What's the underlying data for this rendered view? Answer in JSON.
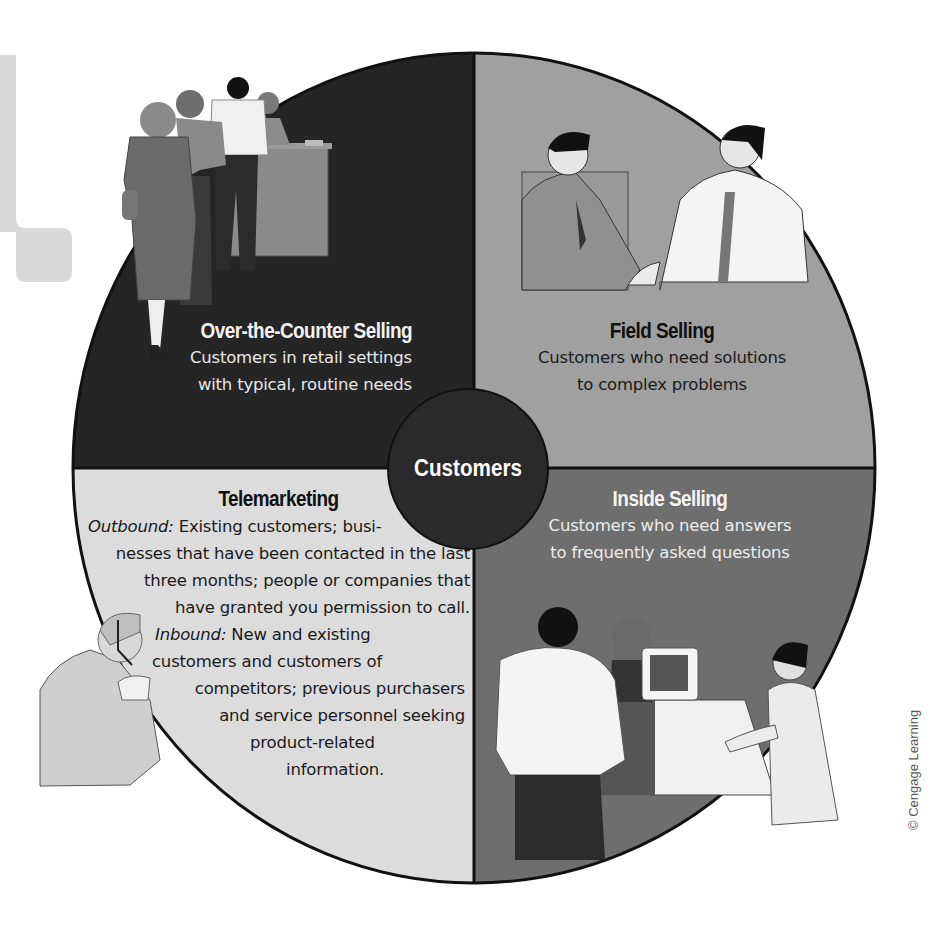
{
  "diagram": {
    "center": {
      "label": "Customers",
      "color": "#2a2a2a"
    },
    "quadrants": [
      {
        "id": "over-the-counter",
        "position": "top-left",
        "title": "Over-the-Counter Selling",
        "lines": [
          "Customers in retail settings",
          "with typical, routine needs"
        ],
        "fill": "#252525",
        "text_color": "#e8e8e8",
        "illustration": "people-waiting-in-line-at-counter"
      },
      {
        "id": "field-selling",
        "position": "top-right",
        "title": "Field Selling",
        "lines": [
          "Customers who need solutions",
          "to complex problems"
        ],
        "fill": "#a0a0a0",
        "text_color": "#1a1a1a",
        "illustration": "two-businessmen-shaking-hands"
      },
      {
        "id": "telemarketing",
        "position": "bottom-left",
        "title": "Telemarketing",
        "outbound_label": "Outbound:",
        "lines": [
          "Existing customers; busi-",
          "nesses that have been contacted in the last",
          "three months; people or companies that",
          "have granted you permission to call."
        ],
        "inbound_label": "Inbound:",
        "inbound_lines": [
          "New and existing",
          "customers and customers of",
          "competitors; previous purchasers",
          "and service personnel seeking",
          "product-related",
          "information."
        ],
        "fill": "#dcdcdc",
        "text_color": "#1a1a1a",
        "illustration": "woman-with-headset"
      },
      {
        "id": "inside-selling",
        "position": "bottom-right",
        "title": "Inside Selling",
        "lines": [
          "Customers who need answers",
          "to frequently asked questions"
        ],
        "fill": "#6e6e6e",
        "text_color": "#ececec",
        "illustration": "customers-at-computer-service-desk"
      }
    ],
    "decoration_color": "#d9d9d9"
  },
  "credit": "© Cengage Learning"
}
